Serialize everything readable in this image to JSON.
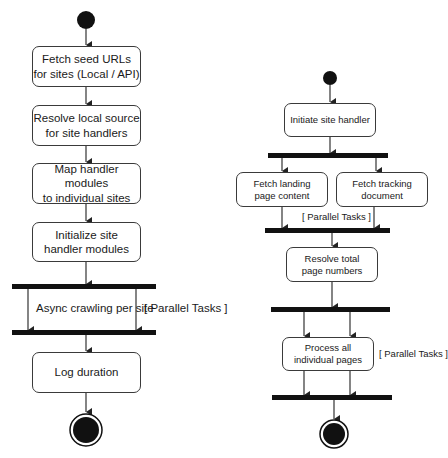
{
  "diagram_left": {
    "title": "Site crawling workflow",
    "activities": [
      {
        "id": "fetch_seed",
        "label": "Fetch seed URLs\nfor sites (Local / API)"
      },
      {
        "id": "resolve_source",
        "label": "Resolve local source\nfor site handlers"
      },
      {
        "id": "map_modules",
        "label": "Map handler modules\nto individual sites"
      },
      {
        "id": "init_modules",
        "label": "Initialize site\nhandler modules"
      },
      {
        "id": "log_duration",
        "label": "Log duration"
      }
    ],
    "parallel_region": {
      "activity": "Async crawling per site",
      "guard": "[ Parallel Tasks ]"
    }
  },
  "diagram_right": {
    "title": "Site handler workflow",
    "activities": [
      {
        "id": "initiate",
        "label": "Initiate site handler"
      },
      {
        "id": "fetch_landing",
        "label": "Fetch landing\npage content"
      },
      {
        "id": "fetch_tracking",
        "label": "Fetch tracking\ndocument"
      },
      {
        "id": "resolve_pages",
        "label": "Resolve total\npage numbers"
      },
      {
        "id": "process_pages",
        "label": "Process all\nindividual pages"
      }
    ],
    "guard_fetch": "[ Parallel Tasks ]",
    "guard_process": "[ Parallel Tasks ]"
  },
  "colors": {
    "stroke": "#3a3a3a",
    "bar": "#111111",
    "node_fill": "#111111",
    "background": "#ffffff"
  }
}
